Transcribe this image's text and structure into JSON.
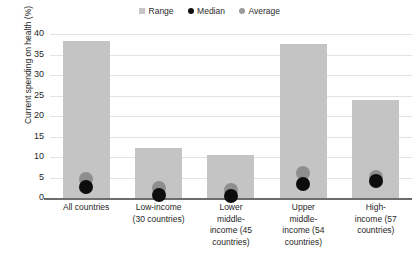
{
  "chart_data": {
    "type": "bar",
    "title": "",
    "xlabel": "",
    "ylabel": "Current spending on health (%)",
    "ylim": [
      0,
      40
    ],
    "yticks": [
      0,
      5,
      10,
      15,
      20,
      25,
      30,
      35,
      40
    ],
    "grid": true,
    "legend_position": "top-center",
    "categories": [
      "All countries",
      "Low-income (30 countries)",
      "Lower middle-income (45 countries)",
      "Upper middle-income (54 countries)",
      "High-income (57 countries)"
    ],
    "category_lines": [
      [
        "All countries"
      ],
      [
        "Low-income",
        "(30 countries)"
      ],
      [
        "Lower",
        "middle-",
        "income (45",
        "countries)"
      ],
      [
        "Upper",
        "middle-",
        "income (54",
        "countries)"
      ],
      [
        "High-",
        "income (57",
        "countries)"
      ]
    ],
    "series": [
      {
        "name": "Range",
        "values": [
          38.2,
          12.3,
          10.5,
          37.5,
          24.0
        ]
      },
      {
        "name": "Median",
        "values": [
          2.6,
          0.8,
          0.5,
          3.4,
          4.2
        ]
      },
      {
        "name": "Average",
        "values": [
          4.6,
          2.4,
          1.9,
          6.0,
          5.2
        ]
      }
    ]
  },
  "legend": {
    "items": [
      {
        "label": "Range",
        "marker": "square-swatch",
        "color": "#c6c6c6"
      },
      {
        "label": "Median",
        "marker": "circle-dot",
        "color": "#111111"
      },
      {
        "label": "Average",
        "marker": "circle-dot",
        "color": "#9a9a9a"
      }
    ]
  },
  "axis": {
    "y_title": "Current spending on health (%)",
    "y_tick_labels": [
      "40",
      "35",
      "30",
      "25",
      "20",
      "15",
      "10",
      "5",
      "0"
    ]
  },
  "colors": {
    "range_bar": "#c4c4c4",
    "median_marker": "#0d0d0d",
    "average_marker": "#8e8e8e",
    "gridline": "#e3e3e3",
    "axis": "#6d6d6d",
    "text": "#1f1f1f",
    "background": "#ffffff"
  }
}
